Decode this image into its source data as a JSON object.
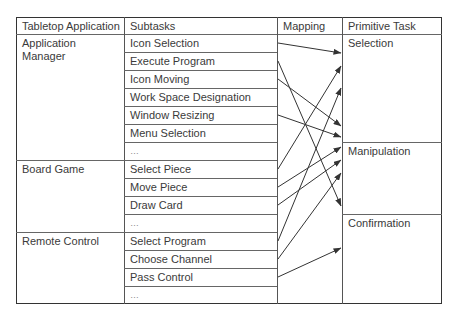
{
  "headers": [
    "Tabletop Application",
    "Subtasks",
    "Mapping",
    "Primitive Task"
  ],
  "applications": [
    {
      "name": "Application\nManager",
      "subtasks": [
        "Icon Selection",
        "Execute Program",
        "Icon Moving",
        "Work Space Designation",
        "Window Resizing",
        "Menu Selection",
        "…"
      ]
    },
    {
      "name": "Board Game",
      "subtasks": [
        "Select Piece",
        "Move Piece",
        "Draw Card",
        "…"
      ]
    },
    {
      "name": "Remote Control",
      "subtasks": [
        "Select Program",
        "Choose Channel",
        "Pass Control",
        "…"
      ]
    }
  ],
  "primitive_tasks": [
    "Selection",
    "Manipulation",
    "Confirmation"
  ],
  "mappings": [
    {
      "from": "Icon Selection",
      "to": "Selection"
    },
    {
      "from": "Execute Program",
      "to": "Confirmation"
    },
    {
      "from": "Icon Moving",
      "to": "Manipulation"
    },
    {
      "from": "Window Resizing",
      "to": "Manipulation"
    },
    {
      "from": "Select Piece",
      "to": "Selection"
    },
    {
      "from": "Move Piece",
      "to": "Manipulation"
    },
    {
      "from": "Draw Card",
      "to": "Manipulation"
    },
    {
      "from": "Select Program",
      "to": "Selection"
    },
    {
      "from": "Choose Channel",
      "to": "Manipulation"
    },
    {
      "from": "Pass Control",
      "to": "Confirmation"
    }
  ]
}
